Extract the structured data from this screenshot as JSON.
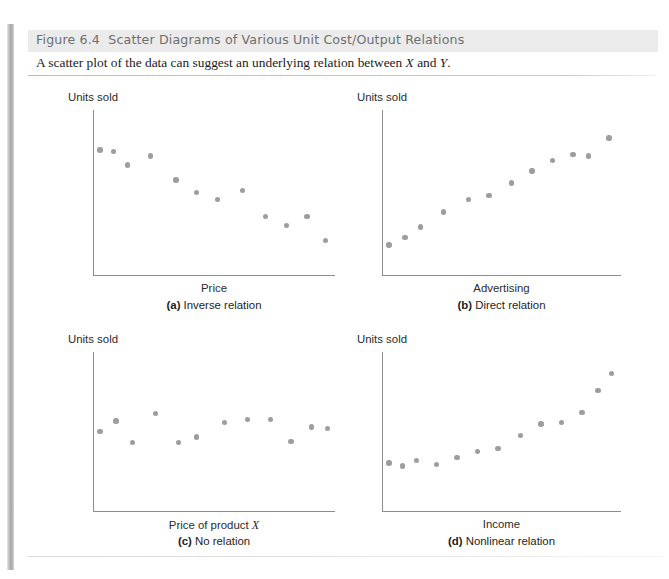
{
  "figure": {
    "number": "Figure 6.4",
    "title": "Scatter Diagrams of Various Unit Cost/Output Relations",
    "subtitle_pre": "A scatter plot of the data can suggest an underlying relation between ",
    "subtitle_x": "X",
    "subtitle_mid": " and ",
    "subtitle_y": "Y",
    "subtitle_end": ".",
    "dot_color": "#9d9d9d",
    "axis_color": "#8d8d8d",
    "header_bg": "#ebebeb"
  },
  "chart_data": [
    {
      "type": "scatter",
      "panel": "a",
      "title": "Inverse relation",
      "caption_tag": "(a)",
      "caption_text": "Inverse relation",
      "xlabel": "Price",
      "ylabel": "Units sold",
      "xlim": [
        0,
        100
      ],
      "ylim": [
        0,
        100
      ],
      "grid": false,
      "n_points": 14,
      "points": [
        {
          "x": 1,
          "y": 78
        },
        {
          "x": 7,
          "y": 77
        },
        {
          "x": 13,
          "y": 68
        },
        {
          "x": 23,
          "y": 74
        },
        {
          "x": 34,
          "y": 58
        },
        {
          "x": 43,
          "y": 50
        },
        {
          "x": 52,
          "y": 45
        },
        {
          "x": 63,
          "y": 51
        },
        {
          "x": 73,
          "y": 34
        },
        {
          "x": 82,
          "y": 28
        },
        {
          "x": 91,
          "y": 34
        },
        {
          "x": 99,
          "y": 18
        }
      ]
    },
    {
      "type": "scatter",
      "panel": "b",
      "title": "Direct relation",
      "caption_tag": "(b)",
      "caption_text": "Direct relation",
      "xlabel": "Advertising",
      "ylabel": "Units sold",
      "xlim": [
        0,
        100
      ],
      "ylim": [
        0,
        100
      ],
      "grid": false,
      "n_points": 13,
      "points": [
        {
          "x": 1,
          "y": 15
        },
        {
          "x": 8,
          "y": 20
        },
        {
          "x": 15,
          "y": 27
        },
        {
          "x": 25,
          "y": 37
        },
        {
          "x": 36,
          "y": 45
        },
        {
          "x": 45,
          "y": 48
        },
        {
          "x": 55,
          "y": 56
        },
        {
          "x": 64,
          "y": 64
        },
        {
          "x": 73,
          "y": 71
        },
        {
          "x": 82,
          "y": 75
        },
        {
          "x": 89,
          "y": 74
        },
        {
          "x": 98,
          "y": 86
        }
      ]
    },
    {
      "type": "scatter",
      "panel": "c",
      "title": "No relation",
      "caption_tag": "(c)",
      "caption_text": "No relation",
      "xlabel_pre": "Price of product ",
      "xlabel_italic": "X",
      "xlabel": "Price of product X",
      "ylabel": "Units sold",
      "xlim": [
        0,
        100
      ],
      "ylim": [
        0,
        100
      ],
      "grid": false,
      "n_points": 12,
      "points": [
        {
          "x": 1,
          "y": 50
        },
        {
          "x": 8,
          "y": 57
        },
        {
          "x": 15,
          "y": 42
        },
        {
          "x": 25,
          "y": 62
        },
        {
          "x": 35,
          "y": 42
        },
        {
          "x": 43,
          "y": 46
        },
        {
          "x": 55,
          "y": 56
        },
        {
          "x": 65,
          "y": 58
        },
        {
          "x": 75,
          "y": 58
        },
        {
          "x": 84,
          "y": 43
        },
        {
          "x": 93,
          "y": 53
        },
        {
          "x": 100,
          "y": 52
        }
      ]
    },
    {
      "type": "scatter",
      "panel": "d",
      "title": "Nonlinear relation",
      "caption_tag": "(d)",
      "caption_text": "Nonlinear relation",
      "xlabel": "Income",
      "ylabel": "Units sold",
      "xlim": [
        0,
        100
      ],
      "ylim": [
        0,
        100
      ],
      "grid": false,
      "n_points": 14,
      "points": [
        {
          "x": 1,
          "y": 28
        },
        {
          "x": 7,
          "y": 26
        },
        {
          "x": 13,
          "y": 30
        },
        {
          "x": 22,
          "y": 27
        },
        {
          "x": 31,
          "y": 32
        },
        {
          "x": 40,
          "y": 36
        },
        {
          "x": 49,
          "y": 38
        },
        {
          "x": 59,
          "y": 47
        },
        {
          "x": 68,
          "y": 55
        },
        {
          "x": 77,
          "y": 56
        },
        {
          "x": 86,
          "y": 63
        },
        {
          "x": 93,
          "y": 78
        },
        {
          "x": 99,
          "y": 90
        }
      ]
    }
  ]
}
